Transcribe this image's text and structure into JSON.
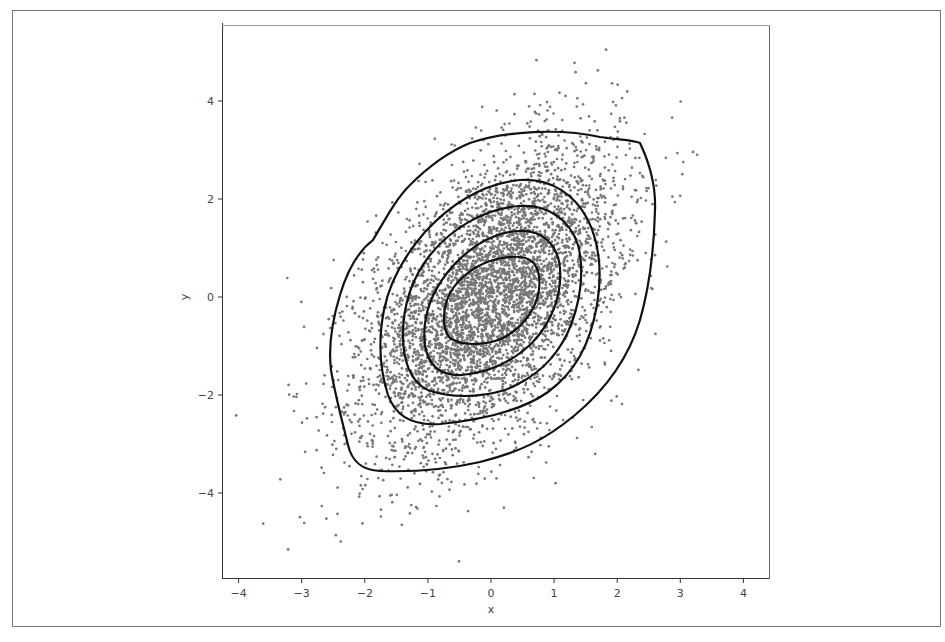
{
  "chart_data": {
    "type": "scatter",
    "subtype": "scatter_with_kde_contours",
    "title": "",
    "xlabel": "x",
    "ylabel": "y",
    "xlim": [
      -4.25,
      4.45
    ],
    "ylim": [
      -5.7,
      5.6
    ],
    "xticks": [
      -4,
      -3,
      -2,
      -1,
      0,
      1,
      2,
      3,
      4
    ],
    "yticks": [
      -4,
      -2,
      0,
      2,
      4
    ],
    "xtick_labels": [
      "−4",
      "−3",
      "−2",
      "−1",
      "0",
      "1",
      "2",
      "3",
      "4"
    ],
    "ytick_labels": [
      "−4",
      "−2",
      "0",
      "2",
      "4"
    ],
    "grid": false,
    "legend": null,
    "series": [
      {
        "name": "samples",
        "kind": "scatter",
        "distribution": "bivariate normal",
        "n_points": 5000,
        "mean": [
          0,
          0
        ],
        "std": [
          1.0,
          1.5
        ],
        "correlation": 0.5,
        "marker_color": "#777777",
        "marker_size_px": 3,
        "x_range_observed": [
          -3.6,
          3.7
        ],
        "y_range_observed": [
          -4.7,
          4.6
        ]
      },
      {
        "name": "density contours",
        "kind": "contour",
        "levels": 5,
        "line_color": "#111111",
        "approx_extents": [
          {
            "level": 1,
            "x": [
              -2.6,
              2.6
            ],
            "y": [
              -3.6,
              3.4
            ]
          },
          {
            "level": 2,
            "x": [
              -1.75,
              1.75
            ],
            "y": [
              -2.6,
              2.4
            ]
          },
          {
            "level": 3,
            "x": [
              -1.4,
              1.4
            ],
            "y": [
              -2.0,
              1.9
            ]
          },
          {
            "level": 4,
            "x": [
              -1.05,
              1.1
            ],
            "y": [
              -1.6,
              1.35
            ]
          },
          {
            "level": 5,
            "x": [
              -0.75,
              0.75
            ],
            "y": [
              -0.9,
              0.8
            ]
          }
        ]
      }
    ]
  },
  "axes": {
    "x_label": "x",
    "y_label": "y",
    "x_ticks": [
      "−4",
      "−3",
      "−2",
      "−1",
      "0",
      "1",
      "2",
      "3",
      "4"
    ],
    "y_ticks": [
      "−4",
      "−2",
      "0",
      "2",
      "4"
    ]
  },
  "colors": {
    "points": "#777777",
    "contours": "#111111",
    "spines": "#333333",
    "frame": "#777777"
  }
}
